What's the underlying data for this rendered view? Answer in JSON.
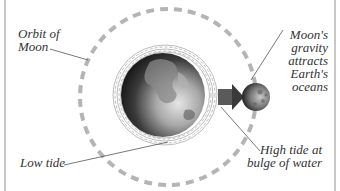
{
  "diagram": {
    "labels": {
      "orbit": [
        "Orbit of",
        "Moon"
      ],
      "moon_gravity": [
        "Moon's",
        "gravity",
        "attracts",
        "Earth's",
        "oceans"
      ],
      "low_tide": "Low tide",
      "high_tide": [
        "High tide at",
        "bulge of water"
      ]
    },
    "colors": {
      "orbit": "#b4b4b4",
      "frame": "#c8c8c8",
      "leader_line": "#555555",
      "waves": "#bdbdbd",
      "arrow": "#5a5a5a",
      "text": "#333333"
    }
  }
}
